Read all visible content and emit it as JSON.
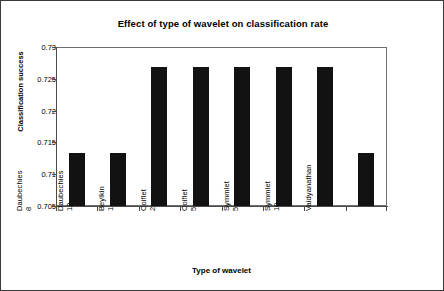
{
  "chart_data": {
    "type": "bar",
    "title": "Effect of type of wavelet on classification rate",
    "xlabel": "Type of wavelet",
    "ylabel": "Classification success",
    "categories": [
      "Daubechies 8",
      "Daubechies 12",
      "Beylkin 1",
      "Coiflet 2",
      "Coiflet 5",
      "Symmlet 5",
      "Symmlet 10",
      "Vaidyanathan"
    ],
    "values": [
      0.7133,
      0.7133,
      0.7268,
      0.7268,
      0.7268,
      0.7268,
      0.7268,
      0.7133
    ],
    "ylim": [
      0.705,
      0.73
    ],
    "yticks": [
      0.705,
      0.71,
      0.715,
      0.72,
      0.725,
      0.73
    ],
    "ytick_labels": [
      "0.705",
      "0.71",
      "0.715",
      "0.72",
      "0.725",
      "0.73"
    ],
    "grid": false,
    "legend": null,
    "bar_color": "#121212",
    "axis_color": "#4a4a4a",
    "plot_background": "#ffffff",
    "figure_border_color": "#3a3a3a"
  }
}
